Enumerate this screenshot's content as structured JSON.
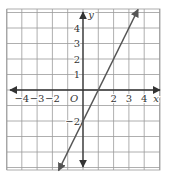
{
  "chart_data": {
    "type": "line",
    "title": "",
    "xlabel": "x",
    "ylabel": "y",
    "origin_label": "O",
    "xlim": [
      -5,
      5
    ],
    "ylim": [
      -5.2,
      5.2
    ],
    "grid": true,
    "x_ticks": [
      {
        "value": -4,
        "label": "−4"
      },
      {
        "value": -3,
        "label": "−3"
      },
      {
        "value": -2,
        "label": "−2"
      },
      {
        "value": 2,
        "label": "2"
      },
      {
        "value": 3,
        "label": "3"
      },
      {
        "value": 4,
        "label": "4"
      }
    ],
    "y_ticks": [
      {
        "value": 4,
        "label": "4"
      },
      {
        "value": 3,
        "label": "3"
      },
      {
        "value": 2,
        "label": "2"
      },
      {
        "value": 1,
        "label": "1"
      },
      {
        "value": -2,
        "label": "−2"
      }
    ],
    "series": [
      {
        "name": "y = 2x - 2",
        "slope": 2,
        "intercept": -2,
        "x": [
          -1.6,
          3.6
        ],
        "y": [
          -5.2,
          5.2
        ],
        "color": "#555555",
        "arrows": "both"
      }
    ]
  },
  "colors": {
    "grid": "#9a9a9a",
    "axis": "#333333",
    "line": "#555555"
  }
}
